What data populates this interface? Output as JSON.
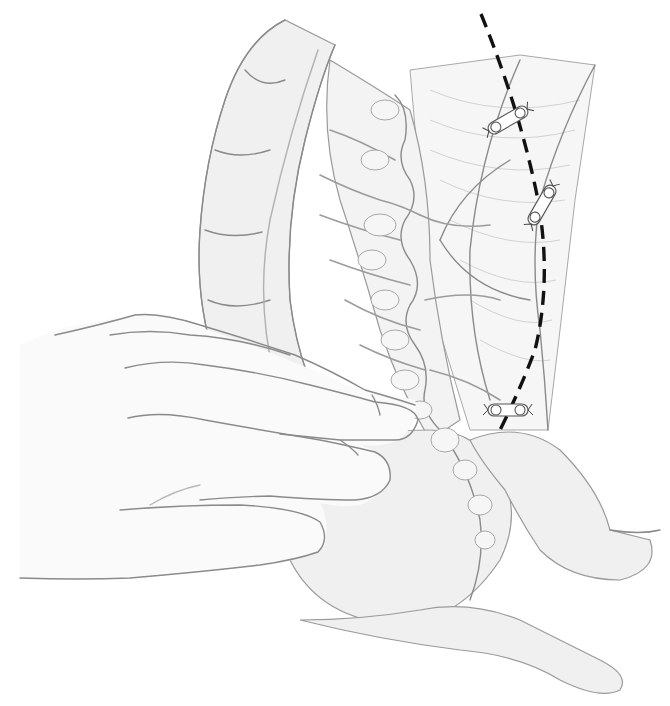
{
  "figure": {
    "type": "medical-illustration",
    "style": "grayscale pencil drawing",
    "colors": {
      "background": "#ffffff",
      "line": "#8a8a8a",
      "shading": "#f0f0f0",
      "incision": "#111111"
    },
    "elements": [
      {
        "id": "colon",
        "label": ""
      },
      {
        "id": "mesentery",
        "label": ""
      },
      {
        "id": "hand",
        "label": ""
      },
      {
        "id": "incision-line",
        "label": ""
      },
      {
        "id": "ligature-clips",
        "count": 3
      }
    ]
  }
}
